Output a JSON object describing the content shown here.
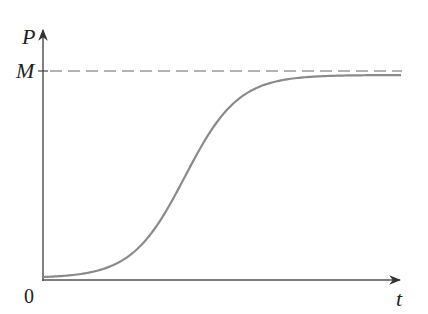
{
  "chart_data": {
    "type": "line",
    "title": "",
    "xlabel": "t",
    "ylabel": "P",
    "origin_label": "0",
    "annotations": [
      {
        "label": "M",
        "type": "horizontal-dashed-asymptote",
        "meaning": "carrying capacity"
      }
    ],
    "grid": false,
    "legend": null,
    "series": [
      {
        "name": "P(t) logistic curve",
        "x": [
          0,
          1,
          2,
          3,
          4,
          5,
          6,
          7,
          8,
          9,
          10
        ],
        "y": [
          0.01,
          0.03,
          0.08,
          0.2,
          0.42,
          0.66,
          0.84,
          0.93,
          0.97,
          0.99,
          0.995
        ]
      }
    ],
    "xlim": [
      0,
      10
    ],
    "ylim": [
      0,
      1.2
    ],
    "units_note": "y normalized so M = 1"
  },
  "labels": {
    "y_axis": "P",
    "x_axis": "t",
    "asymptote": "M",
    "origin": "0"
  },
  "colors": {
    "curve": "#8a8a8a",
    "axes": "#555555",
    "dashed": "#666666"
  }
}
